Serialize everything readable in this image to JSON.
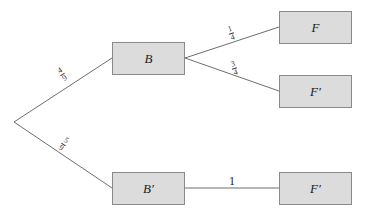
{
  "tree": {
    "root": {
      "x": 14,
      "y": 122
    },
    "nodes": [
      {
        "id": "B",
        "label": "B",
        "x": 112,
        "y": 42,
        "w": 73,
        "h": 33
      },
      {
        "id": "Bp",
        "label": "B′",
        "x": 112,
        "y": 172,
        "w": 73,
        "h": 33
      },
      {
        "id": "F1",
        "label": "F",
        "x": 279,
        "y": 11,
        "w": 73,
        "h": 33
      },
      {
        "id": "F2",
        "label": "F′",
        "x": 279,
        "y": 75,
        "w": 73,
        "h": 33
      },
      {
        "id": "F3",
        "label": "F′",
        "x": 279,
        "y": 172,
        "w": 73,
        "h": 33
      }
    ],
    "edges": [
      {
        "from": "root",
        "to": "B",
        "prob_num": "4",
        "prob_den": "9"
      },
      {
        "from": "root",
        "to": "B′",
        "prob_num": "5",
        "prob_den": "9"
      },
      {
        "from": "B",
        "to": "F",
        "prob_num": "1",
        "prob_den": "4"
      },
      {
        "from": "B",
        "to": "F′",
        "prob_num": "3",
        "prob_den": "4"
      },
      {
        "from": "B′",
        "to": "F′",
        "prob": "1"
      }
    ]
  },
  "colors": {
    "node_fill": "#dcdcdc",
    "node_border": "#8a8a8a",
    "line": "#6e6e6e"
  }
}
